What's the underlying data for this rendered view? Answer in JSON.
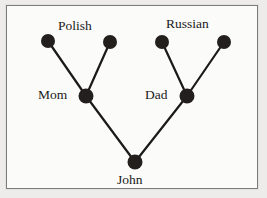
{
  "figure": {
    "kind": "family-tree-diagram",
    "background_color": "#edecea",
    "panel_color": "#fbfbf9",
    "border_color": "#7c7c7c",
    "node_color": "#231f1d",
    "edge_color": "#1c1a18",
    "text_color": "#1a1a1a"
  },
  "labels": {
    "polish": "Polish",
    "russian": "Russian",
    "mom": "Mom",
    "dad": "Dad",
    "john": "John"
  },
  "chart_data": {
    "type": "diagram",
    "nodes": [
      {
        "id": "maternal_grandparent_1",
        "label": "",
        "group": "Polish",
        "x": 48,
        "y": 41,
        "r": 7
      },
      {
        "id": "maternal_grandparent_2",
        "label": "",
        "group": "Polish",
        "x": 110,
        "y": 42,
        "r": 7
      },
      {
        "id": "paternal_grandparent_1",
        "label": "",
        "group": "Russian",
        "x": 162,
        "y": 42,
        "r": 7
      },
      {
        "id": "paternal_grandparent_2",
        "label": "",
        "group": "Russian",
        "x": 224,
        "y": 42,
        "r": 7
      },
      {
        "id": "mom",
        "label": "Mom",
        "group": "parent",
        "x": 86,
        "y": 96,
        "r": 7.5
      },
      {
        "id": "dad",
        "label": "Dad",
        "group": "parent",
        "x": 187,
        "y": 96,
        "r": 7.5
      },
      {
        "id": "john",
        "label": "John",
        "group": "child",
        "x": 135,
        "y": 162,
        "r": 7.5
      }
    ],
    "edges": [
      {
        "from": "maternal_grandparent_1",
        "to": "mom"
      },
      {
        "from": "maternal_grandparent_2",
        "to": "mom"
      },
      {
        "from": "paternal_grandparent_1",
        "to": "dad"
      },
      {
        "from": "paternal_grandparent_2",
        "to": "dad"
      },
      {
        "from": "mom",
        "to": "john"
      },
      {
        "from": "dad",
        "to": "john"
      }
    ],
    "group_labels": [
      {
        "text": "Polish",
        "x": 82,
        "y": 26
      },
      {
        "text": "Russian",
        "x": 196,
        "y": 24
      }
    ]
  }
}
